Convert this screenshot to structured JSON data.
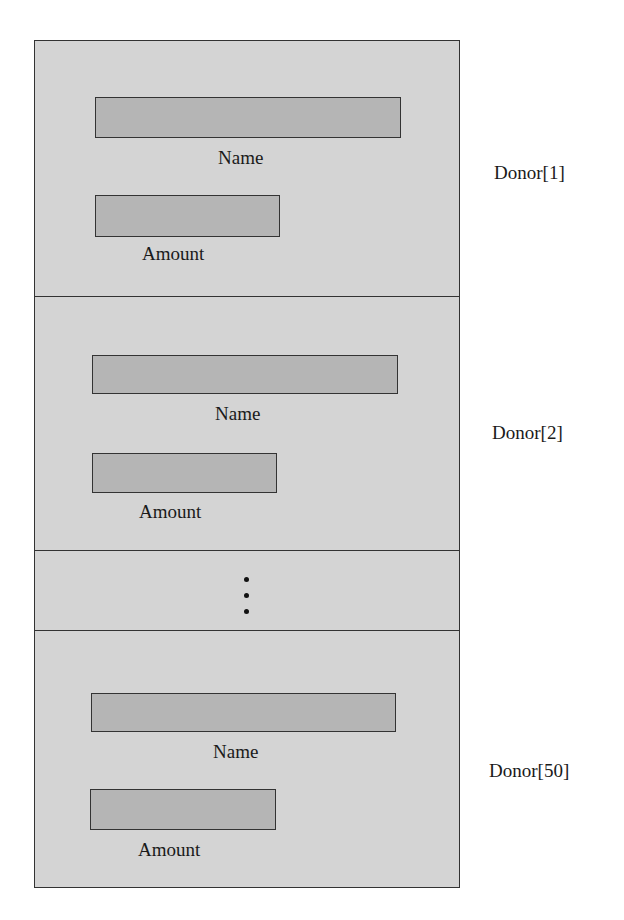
{
  "diagram": {
    "title": "",
    "array_length": 50,
    "elements": [
      {
        "label": "Donor[1]",
        "fields": [
          {
            "name": "name",
            "label": "Name"
          },
          {
            "name": "amount",
            "label": "Amount"
          }
        ]
      },
      {
        "label": "Donor[2]",
        "fields": [
          {
            "name": "name",
            "label": "Name"
          },
          {
            "name": "amount",
            "label": "Amount"
          }
        ]
      },
      {
        "ellipsis": true
      },
      {
        "label": "Donor[50]",
        "fields": [
          {
            "name": "name",
            "label": "Name"
          },
          {
            "name": "amount",
            "label": "Amount"
          }
        ]
      }
    ],
    "colors": {
      "container_fill": "#d4d4d4",
      "field_fill": "#b5b5b5",
      "border": "#333333"
    }
  }
}
